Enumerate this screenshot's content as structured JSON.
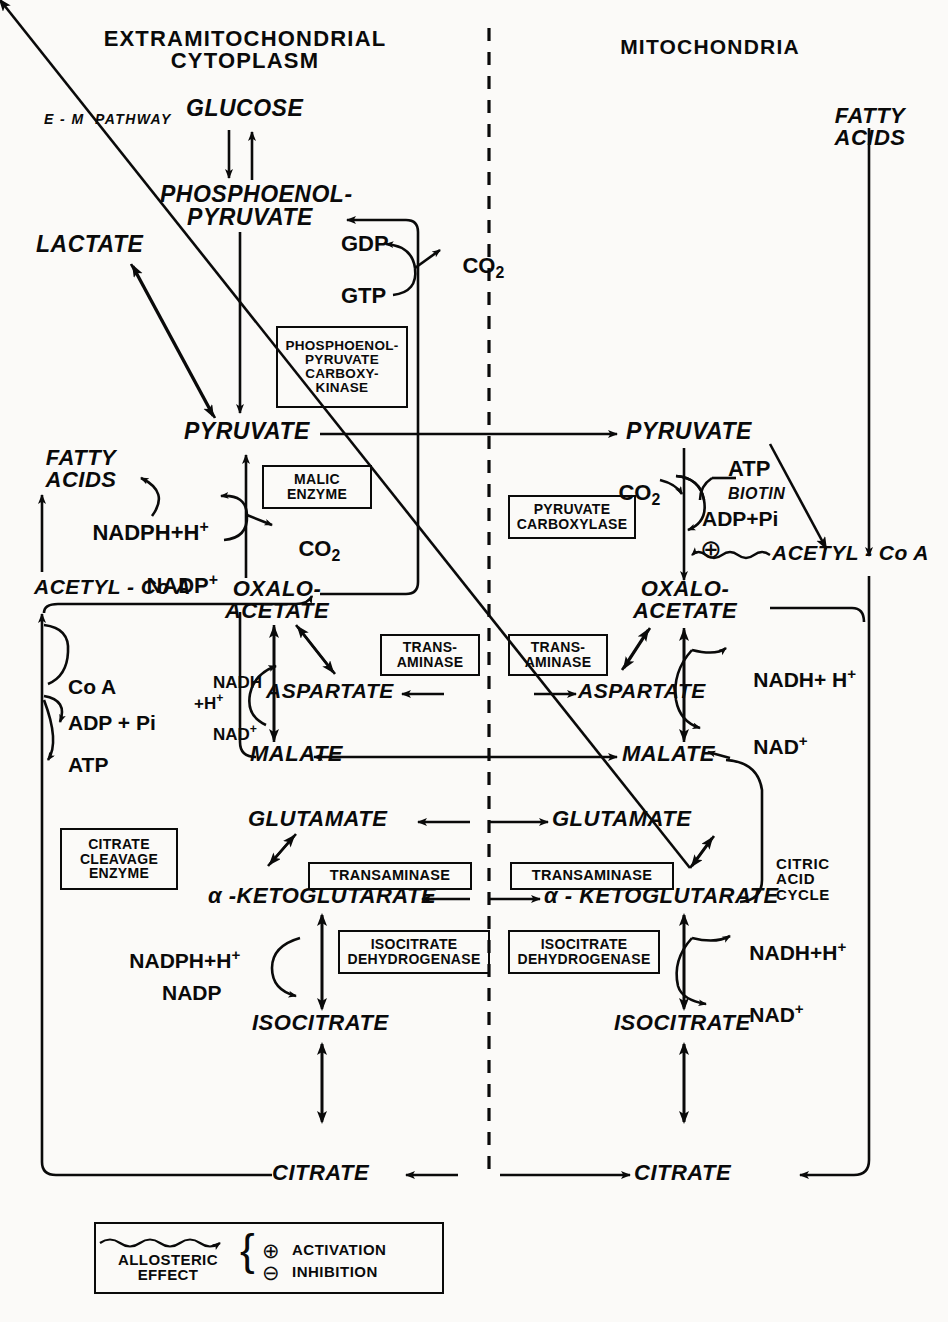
{
  "diagram": {
    "title_left": "EXTRAMITOCHONDRIAL\nCYTOPLASM",
    "title_right": "MITOCHONDRIA",
    "compartment_divider": "dashed-vertical-line"
  },
  "cytoplasm": {
    "pathway_label": "E - M  PATHWAY",
    "metabolites": {
      "glucose": "GLUCOSE",
      "pep": "PHOSPHOENOL-\nPYRUVATE",
      "lactate": "LACTATE",
      "pyruvate": "PYRUVATE",
      "fatty_acids": "FATTY\nACIDS",
      "acetyl_coa": "ACETYL - Co A",
      "oxaloacetate": "OXALO-\nACETATE",
      "aspartate": "ASPARTATE",
      "malate": "MALATE",
      "glutamate": "GLUTAMATE",
      "ketoglutarate": "α -KETOGLUTARATE",
      "isocitrate": "ISOCITRATE",
      "citrate": "CITRATE"
    },
    "cofactors": {
      "gdp": "GDP",
      "gtp": "GTP",
      "co2_pepck": "CO",
      "co2_pepck_sub": "2",
      "nadph_h": "NADPH+H",
      "nadph_h_sup": "+",
      "nadp_plus": "NADP",
      "nadp_plus_sup": "+",
      "co2_malic": "CO",
      "co2_malic_sub": "2",
      "nadh_h": "NADH\n+H",
      "nadh_h_sup": "+",
      "nad_plus": "NAD",
      "nad_plus_sup": "+",
      "coa": "Co A",
      "adp_pi": "ADP + Pi",
      "atp": "ATP",
      "nadph_h_icd": "NADPH+H",
      "nadph_h_icd_sup": "+",
      "nadp_icd": "NADP"
    },
    "enzymes": {
      "pepck": "PHOSPHOENOL-\nPYRUVATE\nCARBOXY-\nKINASE",
      "malic_enzyme": "MALIC\nENZYME",
      "transaminase_asp": "TRANS-\nAMINASE",
      "citrate_cleavage": "CITRATE\nCLEAVAGE\nENZYME",
      "transaminase_glu": "TRANSAMINASE",
      "isocitrate_dh": "ISOCITRATE\nDEHYDROGENASE"
    }
  },
  "mitochondria": {
    "metabolites": {
      "fatty_acids": "FATTY\nACIDS",
      "pyruvate": "PYRUVATE",
      "acetyl_coa": "ACETYL - Co A",
      "oxaloacetate": "OXALO-\nACETATE",
      "aspartate": "ASPARTATE",
      "malate": "MALATE",
      "glutamate": "GLUTAMATE",
      "ketoglutarate": "α - KETOGLUTARATE",
      "isocitrate": "ISOCITRATE",
      "citrate": "CITRATE"
    },
    "cofactors": {
      "co2": "CO",
      "co2_sub": "2",
      "atp": "ATP",
      "biotin": "BIOTIN",
      "adp_pi": "ADP+Pi",
      "nadh_h_mdh": "NADH+ H",
      "nadh_h_mdh_sup": "+",
      "nad_plus_mdh": "NAD",
      "nad_plus_mdh_sup": "+",
      "nadh_h_icd": "NADH+H",
      "nadh_h_icd_sup": "+",
      "nad_plus_icd": "NAD",
      "nad_plus_icd_sup": "+"
    },
    "enzymes": {
      "pyruvate_carboxylase": "PYRUVATE\nCARBOXYLASE",
      "transaminase_asp": "TRANS-\nAMINASE",
      "transaminase_glu": "TRANSAMINASE",
      "isocitrate_dh": "ISOCITRATE\nDEHYDROGENASE"
    },
    "cycle_label": "CITRIC\nACID\nCYCLE",
    "activation_symbol": "⊕"
  },
  "legend": {
    "allosteric": "ALLOSTERIC\nEFFECT",
    "activation_symbol": "⊕",
    "activation_label": "ACTIVATION",
    "inhibition_symbol": "⊖",
    "inhibition_label": "INHIBITION",
    "brace": "{"
  },
  "colors": {
    "ink": "#0a0a0a",
    "paper": "#fbfaf8"
  }
}
